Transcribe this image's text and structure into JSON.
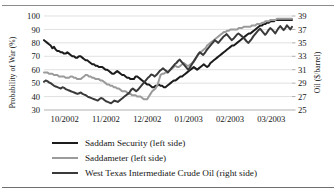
{
  "chart_data": {
    "type": "line",
    "title": "",
    "xlabel": "",
    "ylabel": "Probability of War (%)",
    "y2label": "Oil ($/barrel)",
    "grid": true,
    "legend_position": "below",
    "x_tick_labels": [
      "10/2002",
      "11/2002",
      "12/2002",
      "01/2003",
      "02/2003",
      "03/2003"
    ],
    "y_tick_labels": [
      "100",
      "90",
      "80",
      "70",
      "60",
      "50",
      "40",
      "30"
    ],
    "y2_tick_labels": [
      "39",
      "37",
      "35",
      "33",
      "31",
      "29",
      "27",
      "25"
    ],
    "ylim": [
      30,
      100
    ],
    "y2lim": [
      25,
      39
    ],
    "xlim": [
      "10/2002",
      "03/2003"
    ],
    "series": [
      {
        "name": "Saddam Security (left side)",
        "axis": "left",
        "color": "#1c1c1c",
        "width": 2.0,
        "values": [
          82,
          81,
          80,
          79,
          78,
          76,
          77,
          75,
          74,
          74,
          73,
          73,
          72,
          72,
          73,
          72,
          71,
          70,
          70,
          69,
          69,
          70,
          70,
          69,
          68,
          67,
          67,
          66,
          65,
          64,
          64,
          63,
          63,
          62,
          62,
          62,
          61,
          60,
          60,
          59,
          58,
          57,
          57,
          58,
          59,
          58,
          57,
          56,
          56,
          55,
          54,
          54,
          53,
          53,
          53,
          55,
          55,
          54,
          53,
          52,
          51,
          50,
          49,
          49,
          48,
          47,
          47,
          48,
          48,
          49,
          48,
          48,
          47,
          47,
          48,
          49,
          50,
          51,
          52,
          52,
          53,
          54,
          55,
          55,
          56,
          57,
          58,
          59,
          60,
          61,
          62,
          61,
          60,
          61,
          62,
          63,
          64,
          63,
          62,
          63,
          65,
          66,
          67,
          68,
          69,
          70,
          71,
          72,
          73,
          74,
          75,
          76,
          77,
          78,
          78,
          79,
          80,
          81,
          82,
          83,
          84,
          85,
          86,
          87,
          87,
          88,
          89,
          90,
          91,
          92,
          93,
          93,
          94,
          94,
          95,
          95,
          96,
          96,
          96,
          97,
          97,
          97,
          97,
          97,
          97,
          97,
          97,
          97,
          97,
          97
        ]
      },
      {
        "name": "Saddameter (left side)",
        "axis": "left",
        "color": "#9b9b9b",
        "width": 2.0,
        "values": [
          58,
          58,
          58,
          57,
          57,
          57,
          56,
          56,
          56,
          55,
          55,
          55,
          55,
          54,
          54,
          54,
          55,
          55,
          54,
          54,
          53,
          53,
          53,
          54,
          55,
          56,
          56,
          55,
          55,
          54,
          54,
          53,
          53,
          53,
          52,
          52,
          51,
          50,
          49,
          49,
          48,
          48,
          47,
          47,
          46,
          46,
          45,
          44,
          44,
          44,
          43,
          42,
          42,
          41,
          41,
          41,
          40,
          40,
          40,
          39,
          38,
          38,
          38,
          40,
          42,
          44,
          45,
          46,
          48,
          52,
          56,
          57,
          57,
          58,
          58,
          59,
          60,
          61,
          62,
          63,
          62,
          62,
          63,
          64,
          65,
          64,
          63,
          63,
          64,
          65,
          66,
          68,
          70,
          72,
          73,
          74,
          75,
          76,
          78,
          79,
          80,
          81,
          82,
          83,
          84,
          85,
          86,
          87,
          88,
          88,
          89,
          89,
          90,
          90,
          90,
          90,
          90,
          91,
          91,
          91,
          92,
          92,
          92,
          92,
          92,
          93,
          93,
          93,
          94,
          94,
          94,
          95,
          95,
          96,
          96,
          96,
          97,
          97,
          97,
          97,
          98,
          98,
          98,
          98,
          98,
          98,
          98,
          98,
          98,
          98
        ]
      },
      {
        "name": "West Texas Intermediate Crude Oil (right side)",
        "axis": "right",
        "color": "#3a3a3a",
        "width": 2.0,
        "values": [
          29.2,
          29.4,
          29.3,
          29.1,
          29.0,
          28.8,
          28.6,
          28.5,
          28.4,
          28.3,
          28.2,
          28.4,
          28.3,
          28.1,
          28.0,
          27.9,
          27.8,
          27.7,
          27.6,
          27.5,
          27.4,
          27.5,
          27.6,
          27.4,
          27.3,
          27.2,
          27.0,
          26.9,
          26.8,
          26.7,
          26.6,
          26.5,
          26.4,
          26.6,
          26.8,
          26.7,
          26.5,
          26.3,
          26.2,
          26.1,
          26.0,
          26.2,
          26.4,
          26.3,
          26.2,
          26.4,
          26.6,
          26.8,
          27.0,
          27.2,
          27.4,
          27.6,
          28.0,
          28.2,
          28.0,
          27.8,
          28.0,
          28.3,
          28.6,
          28.9,
          29.2,
          29.5,
          29.8,
          30.0,
          30.3,
          30.2,
          30.0,
          30.2,
          30.5,
          30.8,
          31.0,
          31.2,
          31.0,
          30.8,
          30.6,
          30.9,
          31.2,
          31.5,
          31.8,
          32.0,
          32.3,
          32.5,
          32.2,
          31.9,
          31.6,
          31.3,
          31.0,
          31.3,
          31.7,
          32.1,
          32.5,
          32.9,
          33.3,
          33.6,
          33.4,
          33.2,
          33.5,
          33.9,
          34.2,
          34.5,
          34.8,
          35.1,
          35.4,
          35.2,
          35.0,
          35.3,
          35.6,
          35.9,
          36.1,
          36.3,
          36.0,
          35.7,
          35.4,
          35.6,
          35.9,
          36.2,
          36.4,
          36.2,
          36.0,
          35.8,
          35.5,
          35.2,
          35.0,
          35.3,
          35.6,
          36.0,
          36.3,
          36.6,
          36.9,
          37.1,
          36.8,
          36.5,
          36.2,
          36.5,
          36.9,
          37.2,
          37.0,
          36.7,
          36.4,
          36.8,
          37.2,
          37.5,
          37.2,
          36.9,
          37.2,
          37.6,
          37.3,
          37.0,
          37.4
        ]
      }
    ]
  },
  "legend": {
    "items": [
      {
        "label": "Saddam Security (left side)",
        "color": "#1c1c1c",
        "width": "2.6px"
      },
      {
        "label": "Saddameter (left side)",
        "color": "#9b9b9b",
        "width": "2.2px"
      },
      {
        "label": "West Texas Intermediate Crude Oil (right side)",
        "color": "#3a3a3a",
        "width": "2.6px"
      }
    ]
  }
}
